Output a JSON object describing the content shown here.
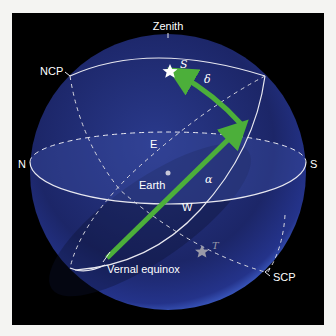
{
  "diagram": {
    "labels": {
      "zenith": "Zenith",
      "ncp": "NCP",
      "scp": "SCP",
      "north": "N",
      "south": "S",
      "east": "E",
      "west": "W",
      "earth": "Earth",
      "vernal_equinox": "Vernal equinox",
      "star_s": "S",
      "star_t": "T",
      "declination": "δ",
      "right_ascension": "α"
    },
    "colors": {
      "background": "#000000",
      "sphere": "#1e2a6e",
      "sphere_edge": "#3a55b8",
      "arrow": "#4caf3a",
      "lines": "#e8e8f0",
      "star_s": "#ffffff",
      "star_t": "#9a9aa8"
    }
  }
}
